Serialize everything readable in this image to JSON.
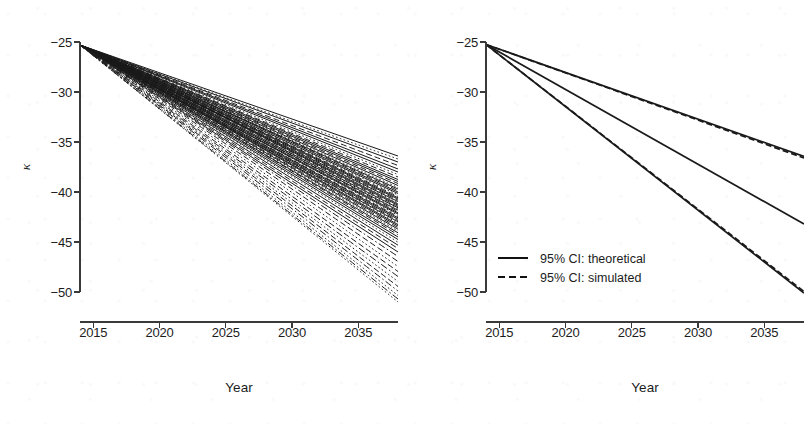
{
  "figure": {
    "panel_count": 2,
    "background_color": "#ffffff",
    "line_color": "#1a1a1a",
    "axis_color": "#3a3a3a"
  },
  "chart_data": [
    {
      "id": "left-panel",
      "type": "line",
      "title": "",
      "xlabel": "Year",
      "ylabel": "κ",
      "xlim": [
        2014,
        2038
      ],
      "ylim": [
        -51.8,
        -24.6
      ],
      "xticks": [
        2015,
        2020,
        2025,
        2030,
        2035
      ],
      "yticks": [
        -25,
        -30,
        -35,
        -40,
        -45,
        -50
      ],
      "xtick_labels": [
        "2015",
        "2020",
        "2025",
        "2030",
        "2035"
      ],
      "ytick_labels": [
        "-25",
        "-30",
        "-35",
        "-40",
        "-45",
        "-50"
      ],
      "grid": false,
      "legend": null,
      "description": "Dense fan of many simulated kappa trajectories, all starting near -25.3 in 2014 and diverging linearly to between -36.5 and -51.0 by 2038.",
      "x": [
        2014,
        2038
      ],
      "origin_value": -25.3,
      "n_trajectories": 64,
      "endpoint_min": -51.0,
      "endpoint_max": -36.4,
      "series": [
        {
          "name": "traj-01",
          "style": "solid",
          "values": [
            -25.3,
            -36.4
          ]
        },
        {
          "name": "traj-02",
          "style": "dotted",
          "values": [
            -25.3,
            -36.7
          ]
        },
        {
          "name": "traj-03",
          "style": "solid",
          "values": [
            -25.3,
            -37.0
          ]
        },
        {
          "name": "traj-04",
          "style": "dashed",
          "values": [
            -25.3,
            -37.35
          ]
        },
        {
          "name": "traj-05",
          "style": "solid",
          "values": [
            -25.3,
            -37.7
          ]
        },
        {
          "name": "traj-06",
          "style": "solid",
          "values": [
            -25.3,
            -38.0
          ]
        },
        {
          "name": "traj-07",
          "style": "dotted",
          "values": [
            -25.3,
            -38.25
          ]
        },
        {
          "name": "traj-08",
          "style": "dashed",
          "values": [
            -25.3,
            -38.5
          ]
        },
        {
          "name": "traj-09",
          "style": "solid",
          "values": [
            -25.3,
            -38.75
          ]
        },
        {
          "name": "traj-10",
          "style": "solid",
          "values": [
            -25.3,
            -38.95
          ]
        },
        {
          "name": "traj-11",
          "style": "dashed",
          "values": [
            -25.3,
            -39.15
          ]
        },
        {
          "name": "traj-12",
          "style": "solid",
          "values": [
            -25.3,
            -39.35
          ]
        },
        {
          "name": "traj-13",
          "style": "dotted",
          "values": [
            -25.3,
            -39.55
          ]
        },
        {
          "name": "traj-14",
          "style": "solid",
          "values": [
            -25.3,
            -39.7
          ]
        },
        {
          "name": "traj-15",
          "style": "dashed",
          "values": [
            -25.3,
            -39.85
          ]
        },
        {
          "name": "traj-16",
          "style": "solid",
          "values": [
            -25.3,
            -40.0
          ]
        },
        {
          "name": "traj-17",
          "style": "solid",
          "values": [
            -25.3,
            -40.15
          ]
        },
        {
          "name": "traj-18",
          "style": "dotted",
          "values": [
            -25.3,
            -40.3
          ]
        },
        {
          "name": "traj-19",
          "style": "dashed",
          "values": [
            -25.3,
            -40.45
          ]
        },
        {
          "name": "traj-20",
          "style": "solid",
          "values": [
            -25.3,
            -40.58
          ]
        },
        {
          "name": "traj-21",
          "style": "solid",
          "values": [
            -25.3,
            -40.7
          ]
        },
        {
          "name": "traj-22",
          "style": "dashed",
          "values": [
            -25.3,
            -40.82
          ]
        },
        {
          "name": "traj-23",
          "style": "solid",
          "values": [
            -25.3,
            -40.95
          ]
        },
        {
          "name": "traj-24",
          "style": "dotted",
          "values": [
            -25.3,
            -41.08
          ]
        },
        {
          "name": "traj-25",
          "style": "solid",
          "values": [
            -25.3,
            -41.2
          ]
        },
        {
          "name": "traj-26",
          "style": "solid",
          "values": [
            -25.3,
            -41.32
          ]
        },
        {
          "name": "traj-27",
          "style": "dashed",
          "values": [
            -25.3,
            -41.45
          ]
        },
        {
          "name": "traj-28",
          "style": "solid",
          "values": [
            -25.3,
            -41.58
          ]
        },
        {
          "name": "traj-29",
          "style": "dotted",
          "values": [
            -25.3,
            -41.7
          ]
        },
        {
          "name": "traj-30",
          "style": "solid",
          "values": [
            -25.3,
            -41.82
          ]
        },
        {
          "name": "traj-31",
          "style": "dashed",
          "values": [
            -25.3,
            -41.95
          ]
        },
        {
          "name": "traj-32",
          "style": "solid",
          "values": [
            -25.3,
            -42.08
          ]
        },
        {
          "name": "traj-33",
          "style": "solid",
          "values": [
            -25.3,
            -42.2
          ]
        },
        {
          "name": "traj-34",
          "style": "dotted",
          "values": [
            -25.3,
            -42.33
          ]
        },
        {
          "name": "traj-35",
          "style": "dashed",
          "values": [
            -25.3,
            -42.46
          ]
        },
        {
          "name": "traj-36",
          "style": "solid",
          "values": [
            -25.3,
            -42.58
          ]
        },
        {
          "name": "traj-37",
          "style": "solid",
          "values": [
            -25.3,
            -42.72
          ]
        },
        {
          "name": "traj-38",
          "style": "dashed",
          "values": [
            -25.3,
            -42.85
          ]
        },
        {
          "name": "traj-39",
          "style": "solid",
          "values": [
            -25.3,
            -42.98
          ]
        },
        {
          "name": "traj-40",
          "style": "dotted",
          "values": [
            -25.3,
            -43.12
          ]
        },
        {
          "name": "traj-41",
          "style": "solid",
          "values": [
            -25.3,
            -43.26
          ]
        },
        {
          "name": "traj-42",
          "style": "solid",
          "values": [
            -25.3,
            -43.4
          ]
        },
        {
          "name": "traj-43",
          "style": "dashed",
          "values": [
            -25.3,
            -43.56
          ]
        },
        {
          "name": "traj-44",
          "style": "solid",
          "values": [
            -25.3,
            -43.72
          ]
        },
        {
          "name": "traj-45",
          "style": "dotted",
          "values": [
            -25.3,
            -43.9
          ]
        },
        {
          "name": "traj-46",
          "style": "solid",
          "values": [
            -25.3,
            -44.08
          ]
        },
        {
          "name": "traj-47",
          "style": "dashed",
          "values": [
            -25.3,
            -44.28
          ]
        },
        {
          "name": "traj-48",
          "style": "solid",
          "values": [
            -25.3,
            -44.5
          ]
        },
        {
          "name": "traj-49",
          "style": "solid",
          "values": [
            -25.3,
            -44.75
          ]
        },
        {
          "name": "traj-50",
          "style": "dotted",
          "values": [
            -25.3,
            -45.02
          ]
        },
        {
          "name": "traj-51",
          "style": "solid",
          "values": [
            -25.3,
            -45.32
          ]
        },
        {
          "name": "traj-52",
          "style": "dashed",
          "values": [
            -25.3,
            -45.65
          ]
        },
        {
          "name": "traj-53",
          "style": "solid",
          "values": [
            -25.3,
            -46.0
          ]
        },
        {
          "name": "traj-54",
          "style": "dashdot",
          "values": [
            -25.3,
            -46.45
          ]
        },
        {
          "name": "traj-55",
          "style": "dashed",
          "values": [
            -25.3,
            -46.95
          ]
        },
        {
          "name": "traj-56",
          "style": "dotted",
          "values": [
            -25.3,
            -47.45
          ]
        },
        {
          "name": "traj-57",
          "style": "dashed",
          "values": [
            -25.3,
            -47.95
          ]
        },
        {
          "name": "traj-58",
          "style": "dashdot",
          "values": [
            -25.3,
            -48.45
          ]
        },
        {
          "name": "traj-59",
          "style": "dotted",
          "values": [
            -25.3,
            -48.95
          ]
        },
        {
          "name": "traj-60",
          "style": "dashed",
          "values": [
            -25.3,
            -49.45
          ]
        },
        {
          "name": "traj-61",
          "style": "dashdot",
          "values": [
            -25.3,
            -49.9
          ]
        },
        {
          "name": "traj-62",
          "style": "dotted",
          "values": [
            -25.3,
            -50.35
          ]
        },
        {
          "name": "traj-63",
          "style": "dashdot",
          "values": [
            -25.3,
            -50.7
          ]
        },
        {
          "name": "traj-64",
          "style": "dotted",
          "values": [
            -25.3,
            -51.0
          ]
        }
      ]
    },
    {
      "id": "right-panel",
      "type": "line",
      "title": "",
      "xlabel": "Year",
      "ylabel": "κ",
      "xlim": [
        2014,
        2038
      ],
      "ylim": [
        -51.8,
        -24.6
      ],
      "xticks": [
        2015,
        2020,
        2025,
        2030,
        2035
      ],
      "yticks": [
        -25,
        -30,
        -35,
        -40,
        -45,
        -50
      ],
      "xtick_labels": [
        "2015",
        "2020",
        "2025",
        "2030",
        "2035"
      ],
      "ytick_labels": [
        "-25",
        "-30",
        "-35",
        "-40",
        "-45",
        "-50"
      ],
      "grid": false,
      "description": "Three near-linear bands from 2014 to 2038: upper CI bound, central forecast, lower CI bound. Theoretical (solid) and simulated (dashed) intervals overlap almost exactly.",
      "x": [
        2014,
        2038
      ],
      "origin_value": -25.25,
      "series": [
        {
          "name": "95% CI upper: theoretical",
          "style": "solid",
          "values": [
            -25.25,
            -36.45
          ]
        },
        {
          "name": "95% CI upper: simulated",
          "style": "dashed",
          "values": [
            -25.25,
            -36.6
          ]
        },
        {
          "name": "central forecast",
          "style": "solid",
          "values": [
            -25.25,
            -43.2
          ]
        },
        {
          "name": "95% CI lower: theoretical",
          "style": "solid",
          "values": [
            -25.25,
            -50.1
          ]
        },
        {
          "name": "95% CI lower: simulated",
          "style": "dashed",
          "values": [
            -25.25,
            -49.95
          ]
        }
      ],
      "legend": {
        "position": "bottom-left",
        "entries": [
          {
            "label": "95% CI: theoretical",
            "style": "solid"
          },
          {
            "label": "95% CI: simulated",
            "style": "dashed"
          }
        ]
      }
    }
  ]
}
